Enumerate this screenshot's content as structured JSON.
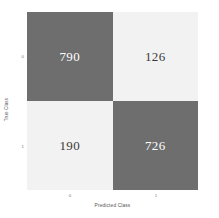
{
  "chart_data": {
    "type": "heatmap",
    "title": "",
    "xlabel": "Predicted Class",
    "ylabel": "True Class",
    "x_ticklabels": [
      "0",
      "1"
    ],
    "y_ticklabels": [
      "0",
      "1"
    ],
    "grid": false,
    "legend": "none",
    "colors": {
      "high": "#6e6e6e",
      "low": "#f2f2f2",
      "text_on_high": "#ffffff",
      "text_on_low": "#3a3a3a",
      "background": "#ffffff",
      "axis_text": "#777777",
      "axis_label": "#555555"
    },
    "matrix": [
      [
        790,
        126
      ],
      [
        190,
        726
      ]
    ],
    "cells": [
      {
        "row": "0",
        "col": "0",
        "value": "790",
        "shade": "high"
      },
      {
        "row": "0",
        "col": "1",
        "value": "126",
        "shade": "low"
      },
      {
        "row": "1",
        "col": "0",
        "value": "190",
        "shade": "low"
      },
      {
        "row": "1",
        "col": "1",
        "value": "726",
        "shade": "high"
      }
    ]
  }
}
